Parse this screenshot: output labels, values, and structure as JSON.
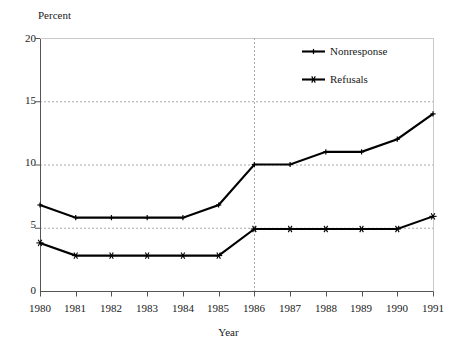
{
  "chart_data": {
    "type": "line",
    "title": "",
    "xlabel": "Year",
    "ylabel": "Percent",
    "categories": [
      "1980",
      "1981",
      "1982",
      "1983",
      "1984",
      "1985",
      "1986",
      "1987",
      "1988",
      "1989",
      "1990",
      "1991"
    ],
    "x": [
      1980,
      1981,
      1982,
      1983,
      1984,
      1985,
      1986,
      1987,
      1988,
      1989,
      1990,
      1991
    ],
    "xlim": [
      1980,
      1991
    ],
    "ylim": [
      0,
      20
    ],
    "yticks": [
      0,
      5,
      10,
      15,
      20
    ],
    "ytick_labels": [
      "0",
      "5",
      "10",
      "15",
      "20"
    ],
    "grid": "horizontal-dashed",
    "legend_position": "top-right",
    "annotations": [
      {
        "type": "vertical-dashed-line",
        "x": 1986,
        "label": ""
      }
    ],
    "series": [
      {
        "name": "Nonresponse",
        "marker": "plus",
        "values": [
          6.8,
          5.8,
          5.8,
          5.8,
          5.8,
          6.8,
          10.0,
          10.0,
          11.0,
          11.0,
          12.0,
          14.0
        ]
      },
      {
        "name": "Refusals",
        "marker": "star",
        "values": [
          3.8,
          2.8,
          2.8,
          2.8,
          2.8,
          2.8,
          4.9,
          4.9,
          4.9,
          4.9,
          4.9,
          5.9
        ]
      }
    ]
  },
  "axis": {
    "y_title": "Percent",
    "x_title": "Year",
    "y_tick_labels": [
      "20",
      "15",
      "10",
      "5",
      "0"
    ],
    "x_tick_labels": [
      "1980",
      "1981",
      "1982",
      "1983",
      "1984",
      "1985",
      "1986",
      "1987",
      "1988",
      "1989",
      "1990",
      "1991"
    ]
  },
  "legend": {
    "items": [
      {
        "label": "Nonresponse",
        "marker": "plus-marker-icon"
      },
      {
        "label": "Refusals",
        "marker": "star-marker-icon"
      }
    ]
  },
  "colors": {
    "line": "#000000",
    "axis": "#555555",
    "grid": "#aaaaaa",
    "background": "#ffffff",
    "text": "#1a1a1a"
  }
}
